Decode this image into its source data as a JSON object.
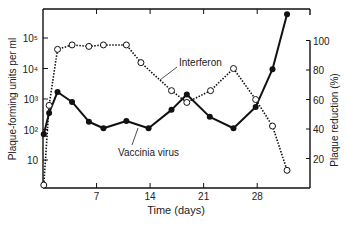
{
  "chart_data": {
    "type": "line",
    "title": "",
    "xlabel": "Time (days)",
    "ylabel_left": "Plaque-forming units per ml",
    "ylabel_right": "Plaque reduction (%)",
    "x_ticks": [
      7,
      14,
      21,
      28
    ],
    "x_tick_labels": [
      "7",
      "14",
      "21",
      "28"
    ],
    "xlim": [
      0,
      33
    ],
    "y_left_scale": "log",
    "y_left_ticks": [
      10,
      100,
      1000,
      10000,
      100000
    ],
    "y_left_tick_labels": [
      "10",
      "10²",
      "10³",
      "10⁴",
      "10⁵"
    ],
    "y_left_lim": [
      1,
      1000000
    ],
    "y_right_ticks": [
      20,
      40,
      60,
      80,
      100
    ],
    "y_right_tick_labels": [
      "20",
      "40",
      "60",
      "80",
      "100"
    ],
    "y_right_lim": [
      0,
      100
    ],
    "grid": false,
    "series": [
      {
        "name": "Vaccinia virus",
        "axis": "left",
        "marker": "filled-circle",
        "line": "solid",
        "x": [
          0.1,
          0.8,
          1.9,
          3.8,
          6.0,
          7.9,
          10.9,
          13.8,
          16.8,
          18.8,
          21.8,
          24.9,
          27.8,
          30.0,
          31.9
        ],
        "values": [
          70,
          350,
          1700,
          800,
          180,
          110,
          190,
          110,
          440,
          1400,
          260,
          110,
          550,
          9500,
          600000
        ]
      },
      {
        "name": "Interferon",
        "axis": "right",
        "marker": "open-circle",
        "line": "dotted",
        "x": [
          0.1,
          0.8,
          1.9,
          3.8,
          6.0,
          7.9,
          10.9,
          12.8,
          16.8,
          18.8,
          21.9,
          24.9,
          27.8,
          30.0,
          31.9
        ],
        "values": [
          2,
          56,
          94,
          97,
          96,
          97,
          97,
          85,
          66,
          58,
          66,
          81,
          60,
          42,
          12
        ]
      }
    ],
    "annotations": [
      {
        "text": "Interferon",
        "points_to": "Interferon series near day 14"
      },
      {
        "text": "Vaccinia virus",
        "points_to": "Vaccinia virus series near day 12"
      }
    ]
  }
}
